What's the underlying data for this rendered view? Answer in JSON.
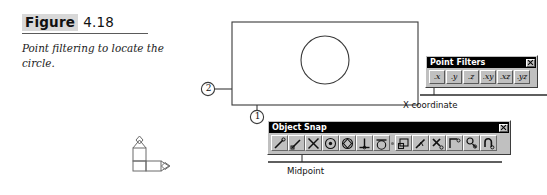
{
  "caption": {
    "figure_word": "Figure",
    "figure_number": "4.18",
    "description": "Point filtering to locate the circle."
  },
  "drawing": {
    "shapes": [
      {
        "name": "rectangle",
        "x": 232,
        "y": 22,
        "width": 186,
        "height": 83
      },
      {
        "name": "circle",
        "cx": 325,
        "cy": 60,
        "r": 24
      }
    ],
    "callouts": [
      {
        "id": "1",
        "label": "1",
        "cx": 257,
        "cy": 117,
        "r": 7,
        "leader_from_y": 105
      },
      {
        "id": "2",
        "label": "2",
        "cx": 208,
        "cy": 89,
        "r": 7,
        "leader_to_x": 232
      }
    ],
    "ucs_icon": {
      "name": "ucs-icon",
      "x_axis_label": "X",
      "y_axis_label": "Y",
      "origin_label": "W"
    }
  },
  "point_filters": {
    "title": "Point Filters",
    "close_label": "Close",
    "buttons": [
      {
        "name": "filter-x",
        "label": ".x",
        "pressed": true
      },
      {
        "name": "filter-y",
        "label": ".y",
        "pressed": false
      },
      {
        "name": "filter-z",
        "label": ".z",
        "pressed": false
      },
      {
        "name": "filter-xy",
        "label": ".xy",
        "pressed": false
      },
      {
        "name": "filter-xz",
        "label": ".xz",
        "pressed": false
      },
      {
        "name": "filter-yz",
        "label": ".yz",
        "pressed": false
      }
    ],
    "annotation": "X coordinate"
  },
  "object_snap": {
    "title": "Object Snap",
    "close_label": "Close",
    "buttons": [
      {
        "name": "snap-from-icon",
        "icon": "tracking-from-icon"
      },
      {
        "name": "snap-endpoint-icon",
        "icon": "endpoint-icon"
      },
      {
        "name": "snap-midpoint-icon",
        "icon": "midpoint-icon"
      },
      {
        "name": "snap-intersection-icon",
        "icon": "intersection-icon"
      },
      {
        "name": "snap-center-icon",
        "icon": "center-icon"
      },
      {
        "name": "snap-quadrant-icon",
        "icon": "quadrant-icon"
      },
      {
        "name": "snap-perpendicular-icon",
        "icon": "perpendicular-icon"
      },
      {
        "name": "snap-tangent-icon",
        "icon": "tangent-icon"
      },
      {
        "name": "snap-node-icon",
        "icon": "node-icon"
      },
      {
        "name": "snap-insertion-icon",
        "icon": "insertion-icon"
      },
      {
        "name": "snap-nearest-icon",
        "icon": "nearest-icon"
      },
      {
        "name": "snap-none-icon",
        "icon": "none-icon"
      },
      {
        "name": "snap-apparent-int-icon",
        "icon": "apparent-intersection-icon"
      },
      {
        "name": "snap-parallel-icon",
        "icon": "parallel-icon"
      },
      {
        "name": "snap-settings-icon",
        "icon": "osnap-settings-icon"
      }
    ],
    "annotation": "Midpoint"
  },
  "colors": {
    "palette_face": "#c0c0c0",
    "titlebar": "#000000",
    "titlebar_text": "#ffffff",
    "line": "#3a3a3a",
    "highlight_bg": "#d8d8d8"
  }
}
